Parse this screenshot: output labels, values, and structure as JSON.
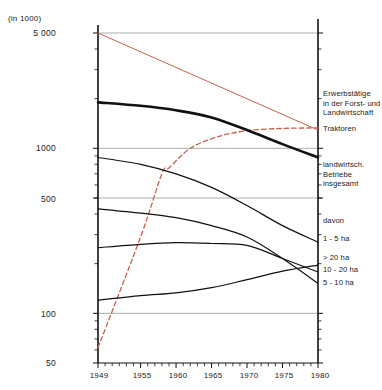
{
  "unit_label": "(in 1000)",
  "chart_data": {
    "type": "line",
    "title": "",
    "subtitle": "",
    "xlabel": "",
    "ylabel": "(in 1000)",
    "yscale": "log",
    "ylim": [
      50,
      5000
    ],
    "xlim": [
      1949,
      1980
    ],
    "grid": true,
    "legend_position": "right",
    "y_ticks": [
      "5 000",
      "1000",
      "500",
      "100",
      "50"
    ],
    "y_tick_values": [
      5000,
      1000,
      500,
      100,
      50
    ],
    "x_ticks": [
      "1949",
      "1955",
      "1960",
      "1965",
      "1970",
      "1975",
      "1980"
    ],
    "x_tick_values": [
      1949,
      1955,
      1960,
      1965,
      1970,
      1975,
      1980
    ],
    "colors": {
      "black": "#111111",
      "red": "#c4604f",
      "grid": "#8a8a8a",
      "axis": "#111111"
    },
    "series": [
      {
        "name": "Erwerbstätige in der Forst- und Landwirtschaft",
        "color": "#c4604f",
        "style": "solid",
        "width": 1,
        "x": [
          1949,
          1980
        ],
        "values": [
          5000,
          1290
        ]
      },
      {
        "name": "Traktoren",
        "color": "#c4604f",
        "style": "dashed",
        "width": 1.3,
        "x": [
          1949,
          1955,
          1958,
          1959,
          1962,
          1966,
          1970,
          1975,
          1980
        ],
        "values": [
          62,
          290,
          700,
          760,
          1000,
          1180,
          1280,
          1320,
          1330
        ]
      },
      {
        "name": "landwirtsch. Betriebe insgesamt",
        "color": "#111111",
        "style": "solid",
        "width": 2.6,
        "x": [
          1949,
          1955,
          1960,
          1965,
          1970,
          1975,
          1980
        ],
        "values": [
          1900,
          1810,
          1700,
          1540,
          1290,
          1060,
          880
        ]
      },
      {
        "name": "1 - 5 ha",
        "color": "#111111",
        "style": "solid",
        "width": 1.2,
        "x": [
          1949,
          1955,
          1960,
          1965,
          1970,
          1975,
          1980
        ],
        "values": [
          880,
          800,
          700,
          580,
          450,
          340,
          270
        ]
      },
      {
        "name": "> 20 ha",
        "color": "#111111",
        "style": "solid",
        "width": 1.2,
        "x": [
          1949,
          1955,
          1960,
          1965,
          1970,
          1975,
          1980
        ],
        "values": [
          120,
          128,
          133,
          143,
          160,
          180,
          196
        ]
      },
      {
        "name": "10 - 20 ha",
        "color": "#111111",
        "style": "solid",
        "width": 1.2,
        "x": [
          1949,
          1955,
          1960,
          1965,
          1970,
          1975,
          1980
        ],
        "values": [
          250,
          262,
          268,
          265,
          258,
          215,
          178
        ]
      },
      {
        "name": "5 - 10 ha",
        "color": "#111111",
        "style": "solid",
        "width": 1.2,
        "x": [
          1949,
          1955,
          1960,
          1965,
          1970,
          1975,
          1980
        ],
        "values": [
          430,
          405,
          380,
          340,
          290,
          215,
          152
        ]
      }
    ],
    "annotations": [
      {
        "text": "davon",
        "x": 1981,
        "y": 440
      }
    ]
  },
  "legend": {
    "entry_red_line1": "Erwerbstätige",
    "entry_red_line2": "in der Forst- und",
    "entry_red_line3": "Landwirtschaft",
    "entry_tractors": "Traktoren",
    "entry_farms_line1": "landwirtsch.",
    "entry_farms_line2": "Betriebe",
    "entry_farms_line3": "insgesamt",
    "entry_davon": "davon",
    "entry_1_5": "1 - 5 ha",
    "entry_gt20": "> 20 ha",
    "entry_10_20": "10 - 20 ha",
    "entry_5_10": "5 - 10 ha"
  }
}
